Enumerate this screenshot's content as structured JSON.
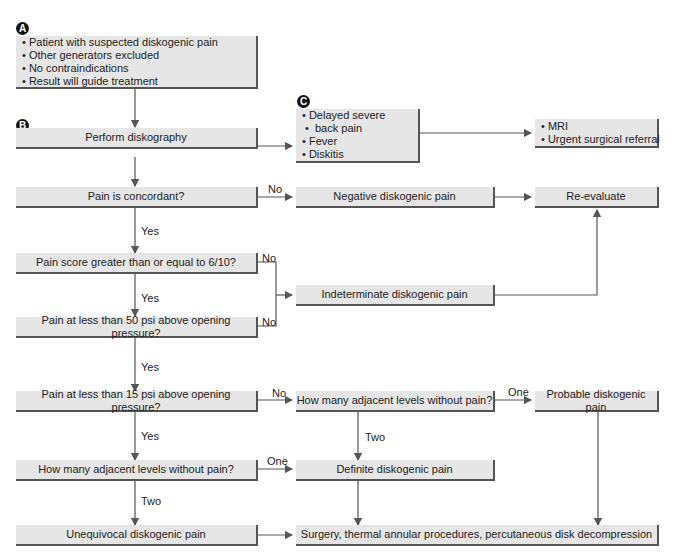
{
  "badges": {
    "a": "A",
    "b": "B",
    "c": "C"
  },
  "nodes": {
    "start": {
      "items": [
        "Patient  with suspected diskogenic pain",
        "Other generators excluded",
        "No contraindications",
        "Result will guide treatment"
      ]
    },
    "perform": {
      "label": "Perform diskography"
    },
    "complications": {
      "items": [
        "Delayed severe",
        " back pain",
        "Fever",
        "Diskitis"
      ]
    },
    "mri": {
      "items": [
        "MRI",
        "Urgent surgical referral"
      ]
    },
    "concordant": {
      "label": "Pain is concordant?"
    },
    "negative": {
      "label": "Negative diskogenic pain"
    },
    "reevaluate": {
      "label": "Re-evaluate"
    },
    "score": {
      "label": "Pain score greater than or equal to 6/10?"
    },
    "indeterminate": {
      "label": "Indeterminate diskogenic pain"
    },
    "psi50": {
      "label": "Pain at less than 50 psi above opening pressure?"
    },
    "psi15": {
      "label": "Pain at less than 15 psi above opening pressure?"
    },
    "levels_right": {
      "label": "How many adjacent levels without pain?"
    },
    "probable": {
      "label": "Probable diskogenic pain"
    },
    "levels_left": {
      "label": "How many adjacent levels without pain?"
    },
    "definite": {
      "label": "Definite diskogenic pain"
    },
    "unequivocal": {
      "label": "Unequivocal diskogenic pain"
    },
    "treatment": {
      "label": "Surgery, thermal annular procedures, percutaneous disk decompression"
    }
  },
  "edge_labels": {
    "concordant_no": "No",
    "concordant_yes": "Yes",
    "score_no": "No",
    "score_yes": "Yes",
    "psi50_no": "No",
    "psi50_yes": "Yes",
    "psi15_no": "No",
    "psi15_yes": "Yes",
    "levels_right_one": "One",
    "levels_right_two": "Two",
    "levels_left_one": "One",
    "levels_left_two": "Two"
  },
  "colors": {
    "box_fill": "#e6e6e6",
    "box_shadow": "#555555",
    "line": "#555555",
    "badge": "#111111"
  }
}
